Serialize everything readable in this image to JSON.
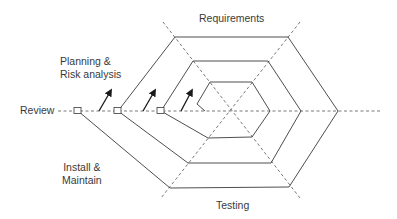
{
  "diagram": {
    "labels": {
      "requirements": "Requirements",
      "planning_line1": "Planning &",
      "planning_line2": "Risk analysis",
      "review": "Review",
      "install_line1": "Install &",
      "install_line2": "Maintain",
      "testing": "Testing"
    },
    "colors": {
      "line": "#3a3a3a",
      "dashed": "#555555",
      "text": "#3a3a3a",
      "background": "#ffffff"
    },
    "phases": [
      "Requirements",
      "Testing",
      "Install & Maintain",
      "Review",
      "Planning & Risk analysis"
    ],
    "spiral_loops": 3,
    "review_checkpoints": 3,
    "progress_arrows": 4
  }
}
